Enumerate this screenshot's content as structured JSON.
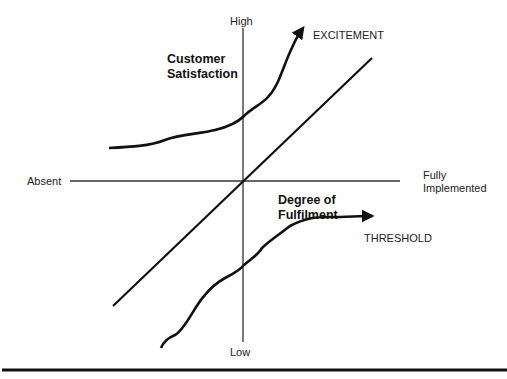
{
  "diagram": {
    "type": "kano-model",
    "axes": {
      "vertical_top": "High",
      "vertical_bottom": "Low",
      "horizontal_left": "Absent",
      "horizontal_right_line1": "Fully",
      "horizontal_right_line2": "Implemented"
    },
    "axis_titles": {
      "y_line1": "Customer",
      "y_line2": "Satisfaction",
      "x_line1": "Degree of",
      "x_line2": "Fulfilment"
    },
    "curves": {
      "excitement": "EXCITEMENT",
      "threshold": "THRESHOLD"
    },
    "colors": {
      "line": "#111111",
      "axis": "#333333",
      "text": "#222222"
    }
  }
}
